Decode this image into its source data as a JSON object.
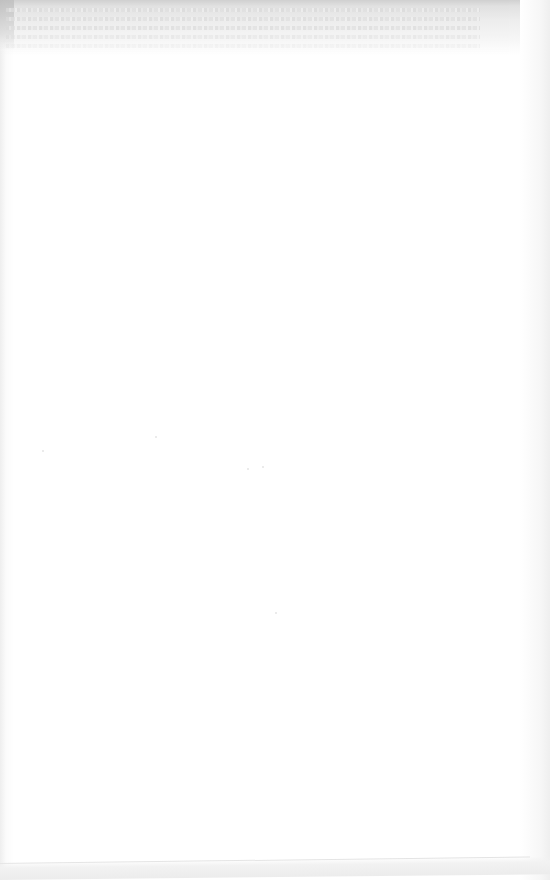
{
  "document": {
    "type": "scanned blank page",
    "body_text": "",
    "notes": "Page is blank; only illegible bleed-through from the reverse side is visible along the top margin."
  },
  "colors": {
    "paper": "#ffffff",
    "bleed_through": "#d0d0d0",
    "edge_shadow": "#ececec"
  }
}
